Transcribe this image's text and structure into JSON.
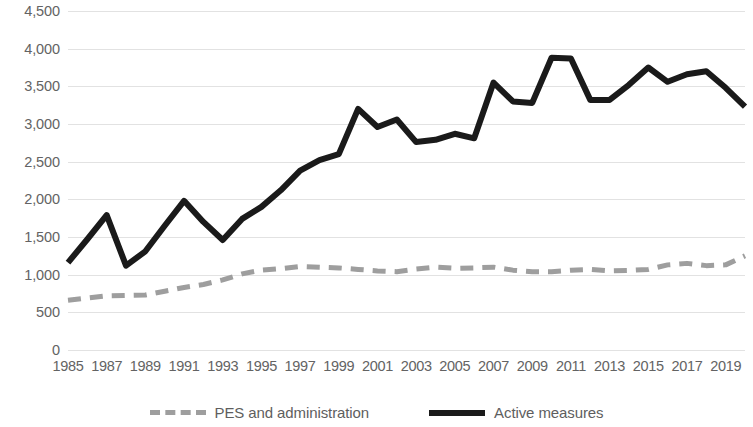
{
  "chart_data": {
    "type": "line",
    "title": "",
    "subtitle": "",
    "xlabel": "",
    "ylabel": "",
    "ylim": [
      0,
      4500
    ],
    "ytick_step": 500,
    "ytick_labels": [
      "4,500",
      "4,000",
      "3,500",
      "3,000",
      "2,500",
      "2,000",
      "1,500",
      "1,000",
      "500",
      "0"
    ],
    "ytick_values": [
      4500,
      4000,
      3500,
      3000,
      2500,
      2000,
      1500,
      1000,
      500,
      0
    ],
    "grid": true,
    "grid_axis": "y",
    "legend_position": "bottom",
    "x": [
      1985,
      1986,
      1987,
      1988,
      1989,
      1990,
      1991,
      1992,
      1993,
      1994,
      1995,
      1996,
      1997,
      1998,
      1999,
      2000,
      2001,
      2002,
      2003,
      2004,
      2005,
      2006,
      2007,
      2008,
      2009,
      2010,
      2011,
      2012,
      2013,
      2014,
      2015,
      2016,
      2017,
      2018,
      2019,
      2020
    ],
    "xtick_labels": [
      "1985",
      "1987",
      "1989",
      "1991",
      "1993",
      "1995",
      "1997",
      "1999",
      "2001",
      "2003",
      "2005",
      "2007",
      "2009",
      "2011",
      "2013",
      "2015",
      "2017",
      "2019"
    ],
    "xtick_values": [
      1985,
      1987,
      1989,
      1991,
      1993,
      1995,
      1997,
      1999,
      2001,
      2003,
      2005,
      2007,
      2009,
      2011,
      2013,
      2015,
      2017,
      2019
    ],
    "series": [
      {
        "name": "PES and administration",
        "style": "dashed",
        "color": "#9e9e9e",
        "width": 5,
        "values": [
          660,
          690,
          720,
          725,
          730,
          780,
          830,
          870,
          930,
          1010,
          1060,
          1080,
          1110,
          1100,
          1090,
          1070,
          1050,
          1040,
          1075,
          1100,
          1085,
          1090,
          1100,
          1060,
          1040,
          1040,
          1060,
          1070,
          1050,
          1055,
          1070,
          1130,
          1150,
          1120,
          1130,
          1250
        ]
      },
      {
        "name": "Active measures",
        "style": "solid",
        "color": "#1a1a1a",
        "width": 6,
        "values": [
          1160,
          1470,
          1790,
          1120,
          1310,
          1650,
          1980,
          1700,
          1460,
          1740,
          1900,
          2120,
          2380,
          2520,
          2600,
          3200,
          2960,
          3060,
          2760,
          2790,
          2870,
          2810,
          3550,
          3300,
          3280,
          3880,
          3870,
          3320,
          3320,
          3520,
          3750,
          3560,
          3660,
          3700,
          3480,
          3230
        ]
      }
    ]
  },
  "legend": {
    "entries": [
      {
        "label": "PES and administration",
        "swatch": "dashed-line-swatch"
      },
      {
        "label": "Active measures",
        "swatch": "solid-line-swatch"
      }
    ]
  }
}
